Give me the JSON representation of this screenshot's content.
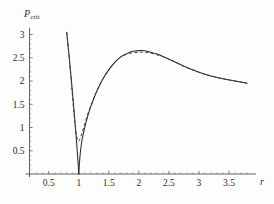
{
  "figure": {
    "background": "#fdfdfd",
    "caption_fragment": "",
    "curve_color": "#262a33",
    "dashed_color": "#3a3f4a"
  },
  "axes": {
    "y_label_main": "P",
    "y_label_sub": "crit",
    "x_label": "r",
    "x_ticks": [
      "0.5",
      "1",
      "1.5",
      "2",
      "2.5",
      "3",
      "3.5"
    ],
    "x_tick_values": [
      0.5,
      1,
      1.5,
      2,
      2.5,
      3,
      3.5
    ],
    "y_ticks": [
      "0.5",
      "1",
      "1.5",
      "2",
      "2.5",
      "3"
    ],
    "y_tick_values": [
      0.5,
      1,
      1.5,
      2,
      2.5,
      3
    ],
    "xlim": [
      0.18,
      3.95
    ],
    "ylim": [
      0,
      3.12
    ]
  },
  "chart_data": {
    "type": "line",
    "title": "",
    "xlabel": "r",
    "ylabel": "P_crit",
    "xlim": [
      0.18,
      3.95
    ],
    "ylim": [
      0,
      3.12
    ],
    "grid": false,
    "legend": "none",
    "annotations": [
      "Solid curve dips to zero at r = 1",
      "Dashed curve dips to about 0.7 at r = 1",
      "Both curves peak near P_crit = 2.65 around r = 2.05",
      "Curves coincide for r greater than about 2.6"
    ],
    "series": [
      {
        "name": "solid",
        "style": "solid",
        "x": [
          0.8,
          0.84,
          0.88,
          0.9,
          0.92,
          0.94,
          0.96,
          0.98,
          1.0,
          1.02,
          1.05,
          1.1,
          1.15,
          1.2,
          1.3,
          1.4,
          1.5,
          1.6,
          1.7,
          1.8,
          1.9,
          2.0,
          2.05,
          2.1,
          2.2,
          2.3,
          2.4,
          2.5,
          2.6,
          2.8,
          3.0,
          3.2,
          3.4,
          3.6,
          3.8
        ],
        "y": [
          3.05,
          2.52,
          1.97,
          1.68,
          1.38,
          1.07,
          0.75,
          0.4,
          0.0,
          0.38,
          0.7,
          1.0,
          1.25,
          1.45,
          1.78,
          2.04,
          2.24,
          2.4,
          2.52,
          2.59,
          2.64,
          2.655,
          2.657,
          2.65,
          2.62,
          2.58,
          2.53,
          2.47,
          2.41,
          2.29,
          2.19,
          2.11,
          2.05,
          2.0,
          1.955
        ]
      },
      {
        "name": "dashed",
        "style": "dashed",
        "x": [
          0.8,
          0.85,
          0.88,
          0.9,
          0.92,
          0.94,
          0.96,
          0.98,
          1.0,
          1.02,
          1.05,
          1.1,
          1.15,
          1.2,
          1.3,
          1.4,
          1.5,
          1.6,
          1.7,
          1.8,
          1.9,
          2.0,
          2.05,
          2.1,
          2.2,
          2.3,
          2.4,
          2.5,
          2.6,
          2.8,
          3.0,
          3.2,
          3.4,
          3.6,
          3.8
        ],
        "y": [
          3.05,
          2.38,
          1.92,
          1.6,
          1.3,
          1.05,
          0.85,
          0.74,
          0.705,
          0.76,
          0.87,
          1.08,
          1.29,
          1.46,
          1.79,
          2.05,
          2.25,
          2.41,
          2.52,
          2.58,
          2.61,
          2.62,
          2.622,
          2.62,
          2.6,
          2.565,
          2.525,
          2.47,
          2.41,
          2.29,
          2.19,
          2.11,
          2.05,
          2.0,
          1.955
        ]
      }
    ]
  }
}
